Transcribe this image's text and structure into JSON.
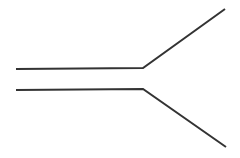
{
  "diagram": {
    "type": "line-drawing",
    "stroke_color": "#333333",
    "stroke_width": 2,
    "background": "#ffffff",
    "paths": [
      {
        "name": "upper-line",
        "points": [
          [
            16,
            69
          ],
          [
            143,
            68
          ],
          [
            225,
            9
          ]
        ]
      },
      {
        "name": "lower-line",
        "points": [
          [
            16,
            90
          ],
          [
            143,
            89
          ],
          [
            226,
            147
          ]
        ]
      }
    ]
  }
}
